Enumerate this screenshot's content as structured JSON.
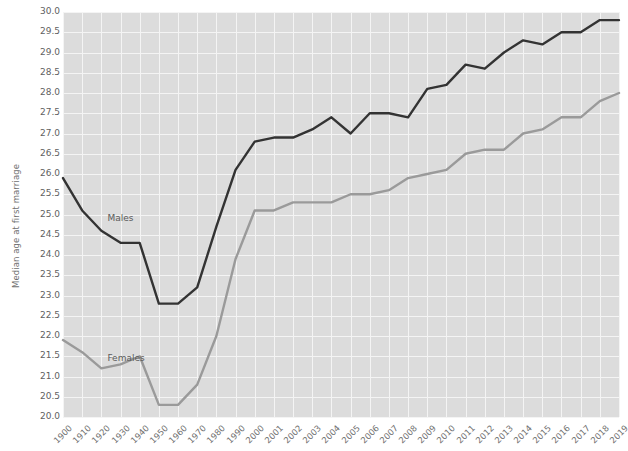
{
  "chart_data": {
    "type": "line",
    "title": "",
    "subtitle": "",
    "xlabel": "",
    "ylabel": "Median age at first marriage",
    "ylim": [
      20.0,
      30.0
    ],
    "ytick_step": 0.5,
    "grid": true,
    "legend_position": "inline-annotation",
    "background": "#dcdcdc",
    "gridline_color": "#f4f4f4",
    "categories": [
      "1900",
      "1910",
      "1920",
      "1930",
      "1940",
      "1950",
      "1960",
      "1970",
      "1980",
      "1990",
      "2000",
      "2001",
      "2002",
      "2003",
      "2004",
      "2005",
      "2006",
      "2007",
      "2008",
      "2009",
      "2010",
      "2011",
      "2012",
      "2013",
      "2014",
      "2015",
      "2016",
      "2017",
      "2018",
      "2019"
    ],
    "ytick_labels": [
      "30.0",
      "29.5",
      "29.0",
      "28.5",
      "28.0",
      "27.5",
      "27.0",
      "26.5",
      "26.0",
      "25.5",
      "25.0",
      "24.5",
      "24.0",
      "23.5",
      "23.0",
      "22.5",
      "22.0",
      "21.5",
      "21.0",
      "20.5",
      "20.0"
    ],
    "series": [
      {
        "name": "Males",
        "color": "#333333",
        "annotation": "Males",
        "values": [
          25.9,
          25.1,
          24.6,
          24.3,
          24.3,
          22.8,
          22.8,
          23.2,
          24.7,
          26.1,
          26.8,
          26.9,
          26.9,
          27.1,
          27.4,
          27.0,
          27.5,
          27.5,
          27.4,
          28.1,
          28.2,
          28.7,
          28.6,
          29.0,
          29.3,
          29.2,
          29.5,
          29.5,
          29.8,
          29.8
        ]
      },
      {
        "name": "Females",
        "color": "#9a9a9a",
        "annotation": "Females",
        "values": [
          21.9,
          21.6,
          21.2,
          21.3,
          21.5,
          20.3,
          20.3,
          20.8,
          22.0,
          23.9,
          25.1,
          25.1,
          25.3,
          25.3,
          25.3,
          25.5,
          25.5,
          25.6,
          25.9,
          26.0,
          26.1,
          26.5,
          26.6,
          26.6,
          27.0,
          27.1,
          27.4,
          27.4,
          27.8,
          28.0
        ]
      }
    ]
  },
  "axes": {
    "y_title": "Median age at first marriage"
  }
}
